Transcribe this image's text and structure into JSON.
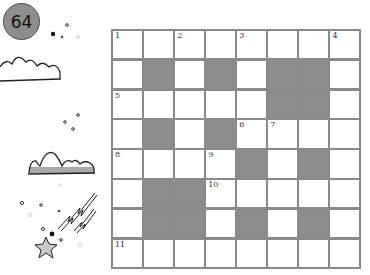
{
  "page_badge": {
    "number": "64",
    "color": "#8e8e8e"
  },
  "crossword": {
    "rows": 8,
    "cols": 8,
    "colors": {
      "border": "#8a8a8a",
      "black_cell": "#8c8c8c",
      "white_cell": "#ffffff"
    },
    "layout": [
      "WWWWWWWW",
      "WBWBWBBW",
      "WWWWWBBW",
      "WBWBWWWW",
      "WWWWBWBW",
      "WBBWWWWW",
      "WBBWBWBW",
      "WWWWWWWW"
    ],
    "clue_numbers": [
      {
        "row": 0,
        "col": 0,
        "number": "1"
      },
      {
        "row": 0,
        "col": 2,
        "number": "2"
      },
      {
        "row": 0,
        "col": 4,
        "number": "3"
      },
      {
        "row": 0,
        "col": 7,
        "number": "4"
      },
      {
        "row": 2,
        "col": 0,
        "number": "5"
      },
      {
        "row": 3,
        "col": 4,
        "number": "6"
      },
      {
        "row": 3,
        "col": 5,
        "number": "7"
      },
      {
        "row": 4,
        "col": 0,
        "number": "8"
      },
      {
        "row": 4,
        "col": 3,
        "number": "9"
      },
      {
        "row": 5,
        "col": 3,
        "number": "10"
      },
      {
        "row": 7,
        "col": 0,
        "number": "11"
      }
    ]
  },
  "decorations": [
    "cloud-outline-icon",
    "cloud-filled-icon",
    "shooting-star-icon",
    "dots"
  ]
}
